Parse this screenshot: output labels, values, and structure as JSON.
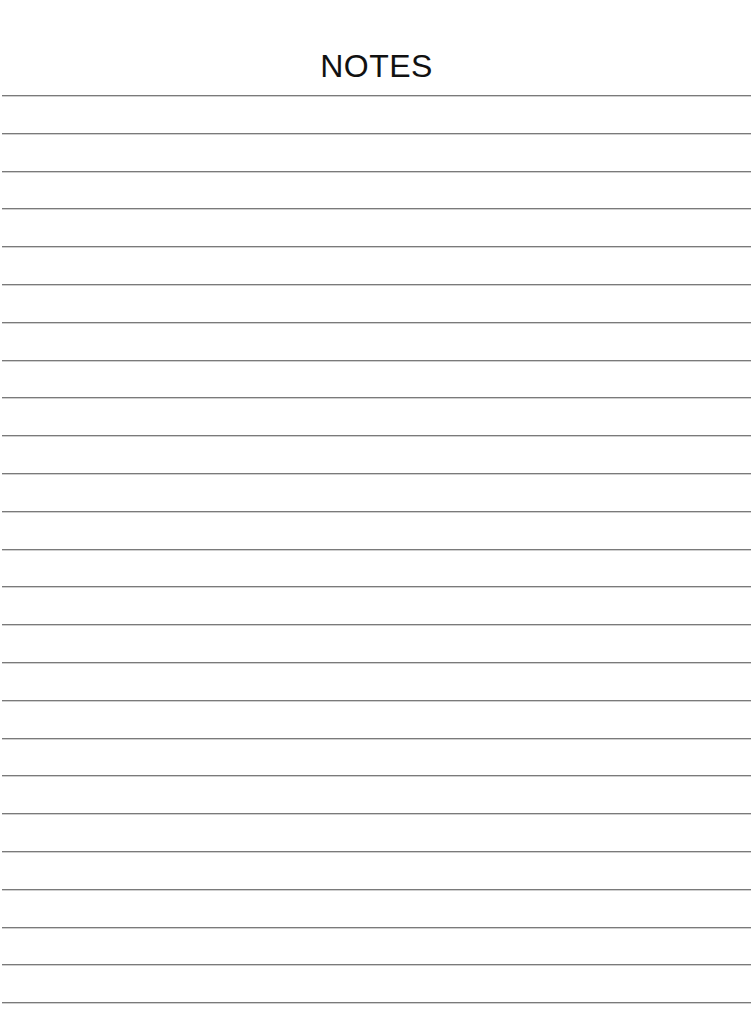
{
  "page": {
    "title": "NOTES",
    "line_count": 25,
    "line_spacing_px": 37.8,
    "line_color": "#7a7a7a",
    "background_color": "#ffffff"
  }
}
